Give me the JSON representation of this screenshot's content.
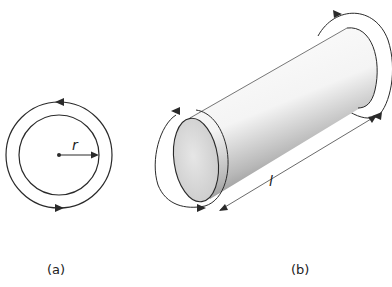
{
  "figure": {
    "panel_a": {
      "caption": "(a)",
      "radius_label": "r",
      "description": "Cross-section circle with radius arrow and circulating torque arrows"
    },
    "panel_b": {
      "caption": "(b)",
      "length_label": "l",
      "description": "Cylinder with torques applied at both ends and length dimension"
    }
  },
  "colors": {
    "stroke": "#2a2a2a",
    "face_fill": "#d8d8d8",
    "background": "#ffffff"
  }
}
